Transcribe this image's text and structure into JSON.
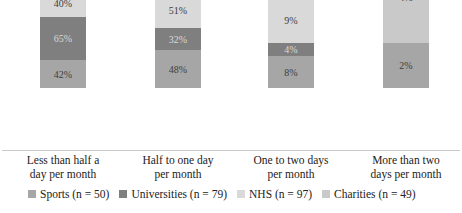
{
  "chart_data": {
    "type": "bar",
    "stacked": true,
    "title": "",
    "xlabel": "",
    "ylabel": "",
    "grid": false,
    "legend_position": "bottom",
    "categories": [
      "Less than half a day per month",
      "Half to one day per month",
      "One to two days per month",
      "More than two days per month"
    ],
    "category_lines": [
      [
        "Less than half a",
        "day per month"
      ],
      [
        "Half to one day",
        "per month"
      ],
      [
        "One to two days",
        "per month"
      ],
      [
        "More than two",
        "days per month"
      ]
    ],
    "series": [
      {
        "name": "Sports (n = 50)",
        "color": "#a6a6a6",
        "values": [
          42,
          48,
          8,
          2
        ],
        "labels": [
          "42%",
          "48%",
          "8%",
          "2%"
        ]
      },
      {
        "name": "Universities (n = 79)",
        "color": "#7f7f7f",
        "values": [
          65,
          32,
          4,
          0
        ],
        "labels": [
          "65%",
          "32%",
          "4%",
          ""
        ]
      },
      {
        "name": "NHS (n = 97)",
        "color": "#d9d9d9",
        "values": [
          40,
          51,
          9,
          0
        ],
        "labels": [
          "40%",
          "51%",
          "9%",
          ""
        ]
      },
      {
        "name": "Charities (n = 49)",
        "color": "#c9c9c9",
        "values": [
          57,
          24,
          14,
          4
        ],
        "labels": [
          "57%",
          "24%",
          "14%",
          "4%"
        ]
      }
    ],
    "segment_heights_px": [
      [
        28,
        43,
        27,
        39
      ],
      [
        38,
        22,
        35,
        42
      ],
      [
        32,
        13,
        45,
        47
      ],
      [
        45,
        0,
        0,
        92
      ]
    ],
    "bar_left_px": [
      40,
      155,
      268,
      383
    ]
  }
}
